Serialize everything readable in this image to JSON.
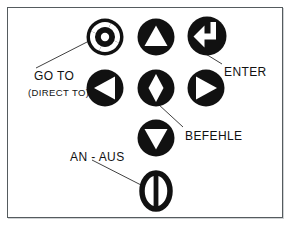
{
  "figure": {
    "background_color": "#ffffff",
    "frame_color": "#555b5e",
    "ink_color": "#111111",
    "icon_fill": "#111111",
    "icon_glyph_color": "#ffffff"
  },
  "buttons": [
    {
      "id": "go-to",
      "icon_name": "goto-target-icon",
      "shape": "circle-with-segmented-ring-and-center-dot",
      "row": 1,
      "col": 1
    },
    {
      "id": "up",
      "icon_name": "triangle-up-icon",
      "shape": "circle-with-up-triangle",
      "row": 1,
      "col": 2
    },
    {
      "id": "enter",
      "icon_name": "enter-return-arrow-icon",
      "shape": "circle-with-return-arrow",
      "row": 1,
      "col": 3
    },
    {
      "id": "left",
      "icon_name": "triangle-left-icon",
      "shape": "circle-with-left-triangle",
      "row": 2,
      "col": 1
    },
    {
      "id": "befehle",
      "icon_name": "diamond-icon",
      "shape": "circle-with-diamond",
      "row": 2,
      "col": 2
    },
    {
      "id": "right",
      "icon_name": "triangle-right-icon",
      "shape": "circle-with-right-triangle",
      "row": 2,
      "col": 3
    },
    {
      "id": "down",
      "icon_name": "triangle-down-icon",
      "shape": "circle-with-down-triangle",
      "row": 3,
      "col": 2
    },
    {
      "id": "power",
      "icon_name": "power-on-off-icon",
      "shape": "ring-with-vertical-bar",
      "row": 4,
      "col": 2
    }
  ],
  "labels": {
    "go_to": "GO TO",
    "direct_to": "(DIRECT TO)",
    "enter": "ENTER",
    "befehle": "BEFEHLE",
    "an_aus": "AN - AUS"
  }
}
